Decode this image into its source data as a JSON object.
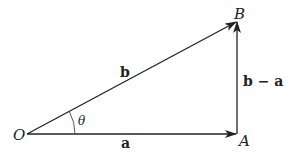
{
  "diagram": {
    "type": "vector-triangle",
    "points": {
      "O": {
        "label": "O",
        "x": 27,
        "y": 134
      },
      "A": {
        "label": "A",
        "x": 237,
        "y": 134
      },
      "B": {
        "label": "B",
        "x": 237,
        "y": 21
      }
    },
    "vectors": [
      {
        "from": "O",
        "to": "A",
        "label": "a"
      },
      {
        "from": "O",
        "to": "B",
        "label": "b"
      },
      {
        "from": "A",
        "to": "B",
        "label": "b − a"
      }
    ],
    "angle": {
      "at": "O",
      "label": "θ"
    },
    "labels": {
      "point_O": "O",
      "point_A": "A",
      "point_B": "B",
      "vector_a": "a",
      "vector_b": "b",
      "vector_b_minus_a": "b − a",
      "angle_theta": "θ"
    },
    "colors": {
      "stroke": "#222222",
      "background": "#ffffff"
    }
  }
}
